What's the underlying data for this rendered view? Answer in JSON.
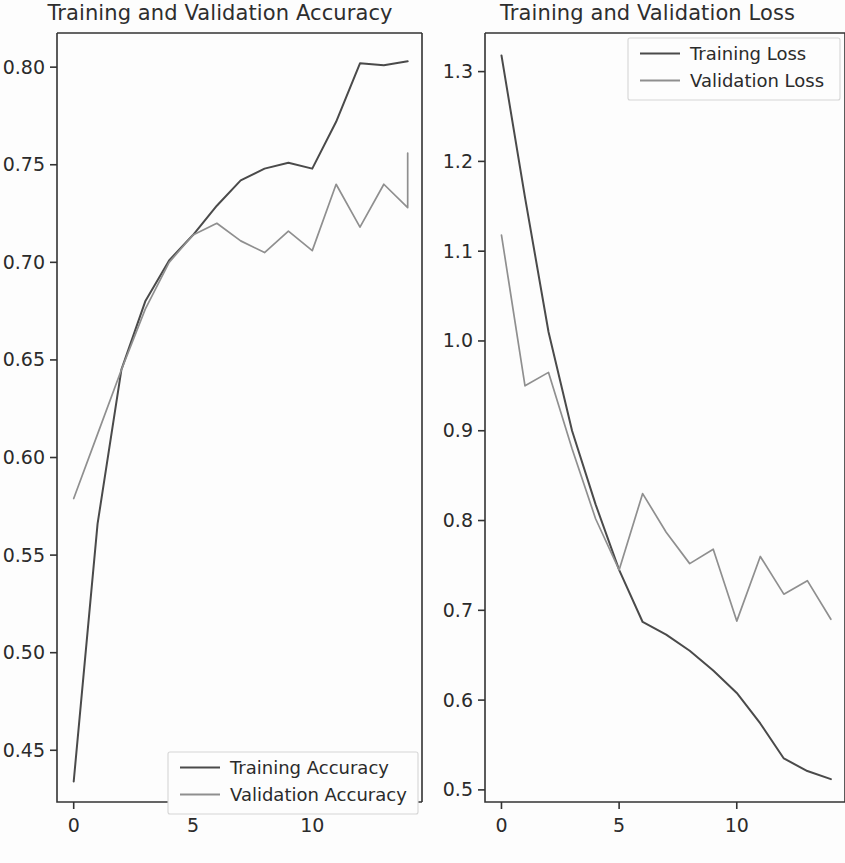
{
  "figure": {
    "background_color": "#fdfdfd",
    "width": 845,
    "height": 863
  },
  "panels": [
    {
      "id": "accuracy",
      "title": "Training and Validation Accuracy",
      "legend_position": "lower right"
    },
    {
      "id": "loss",
      "title": "Training and Validation Loss",
      "legend_position": "upper right"
    }
  ],
  "colors": {
    "training_line": "#4a4a4a",
    "validation_line": "#8f8f8f",
    "axis": "#333333",
    "text": "#2b2b2b",
    "legend_border": "#d6d6d6"
  },
  "chart_data": [
    {
      "type": "line",
      "title": "Training and Validation Accuracy",
      "xlabel": "",
      "ylabel": "",
      "grid": false,
      "legend_position": "lower right",
      "x": [
        0,
        1,
        2,
        3,
        4,
        5,
        6,
        7,
        8,
        9,
        10,
        11,
        12,
        13,
        14
      ],
      "xlim": [
        -0.7,
        14.6
      ],
      "ylim": [
        0.4235,
        0.8175
      ],
      "xticks": [
        0,
        5,
        10
      ],
      "xticklabels": [
        "0",
        "5",
        "10"
      ],
      "yticks": [
        0.45,
        0.5,
        0.55,
        0.6,
        0.65,
        0.7,
        0.75,
        0.8
      ],
      "yticklabels": [
        "0.45",
        "0.50",
        "0.55",
        "0.60",
        "0.65",
        "0.70",
        "0.75",
        "0.80"
      ],
      "series": [
        {
          "name": "Training Accuracy",
          "color": "#4a4a4a",
          "values": [
            0.434,
            0.566,
            0.645,
            0.68,
            0.701,
            0.714,
            0.729,
            0.742,
            0.748,
            0.751,
            0.748,
            0.772,
            0.802,
            0.801,
            0.803
          ]
        },
        {
          "name": "Validation Accuracy",
          "color": "#8f8f8f",
          "values": [
            0.579,
            0.612,
            0.645,
            0.676,
            0.7,
            0.714,
            0.72,
            0.711,
            0.705,
            0.716,
            0.706,
            0.74,
            0.718,
            0.74,
            0.728,
            0.756
          ]
        }
      ]
    },
    {
      "type": "line",
      "title": "Training and Validation Loss",
      "xlabel": "",
      "ylabel": "",
      "grid": false,
      "legend_position": "upper right",
      "x": [
        0,
        1,
        2,
        3,
        4,
        5,
        6,
        7,
        8,
        9,
        10,
        11,
        12,
        13,
        14
      ],
      "xlim": [
        -0.7,
        14.6
      ],
      "ylim": [
        0.4865,
        1.343
      ],
      "xticks": [
        0,
        5,
        10
      ],
      "xticklabels": [
        "0",
        "5",
        "10"
      ],
      "yticks": [
        0.5,
        0.6,
        0.7,
        0.8,
        0.9,
        1.0,
        1.1,
        1.2,
        1.3
      ],
      "yticklabels": [
        "0.5",
        "0.6",
        "0.7",
        "0.8",
        "0.9",
        "1.0",
        "1.1",
        "1.2",
        "1.3"
      ],
      "series": [
        {
          "name": "Training Loss",
          "color": "#4a4a4a",
          "values": [
            1.318,
            1.16,
            1.01,
            0.9,
            0.818,
            0.745,
            0.687,
            0.673,
            0.655,
            0.633,
            0.608,
            0.574,
            0.535,
            0.521,
            0.512
          ]
        },
        {
          "name": "Validation Loss",
          "color": "#8f8f8f",
          "values": [
            1.118,
            0.95,
            0.965,
            0.88,
            0.802,
            0.745,
            0.83,
            0.787,
            0.752,
            0.768,
            0.688,
            0.76,
            0.718,
            0.733,
            0.69
          ]
        }
      ]
    }
  ],
  "legends": [
    {
      "panel": "accuracy",
      "entries": [
        {
          "label": "Training Accuracy",
          "color": "#4a4a4a"
        },
        {
          "label": "Validation Accuracy",
          "color": "#8f8f8f"
        }
      ]
    },
    {
      "panel": "loss",
      "entries": [
        {
          "label": "Training Loss",
          "color": "#4a4a4a"
        },
        {
          "label": "Validation Loss",
          "color": "#8f8f8f"
        }
      ]
    }
  ]
}
